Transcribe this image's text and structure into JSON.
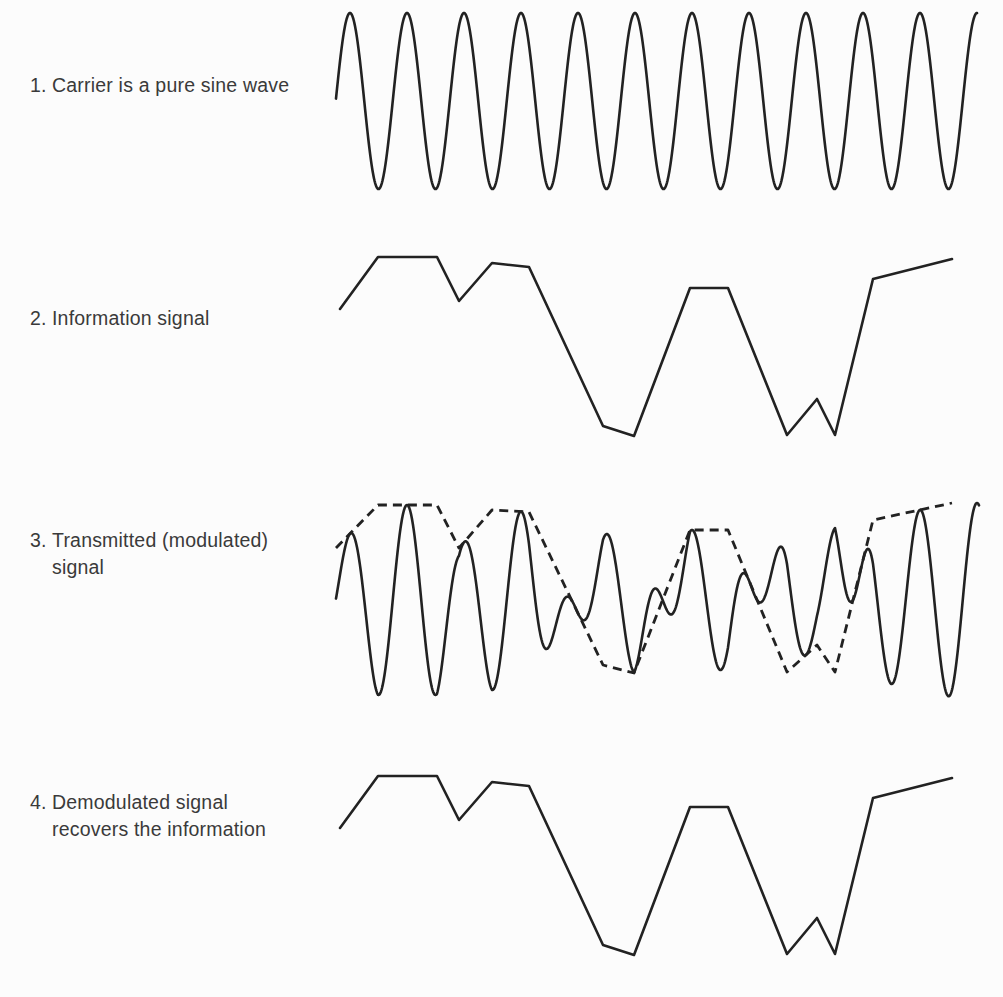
{
  "figure": {
    "background_color": "#fcfcfc",
    "line_color": "#222222",
    "text_color": "#3a3a3a"
  },
  "panels": [
    {
      "number": "1.",
      "label": "Carrier is a pure sine wave",
      "label_top": 45,
      "kind": "sine",
      "name": "carrier"
    },
    {
      "number": "2.",
      "label": "Information signal",
      "label_top": 278,
      "kind": "polyline",
      "name": "information"
    },
    {
      "number": "3.",
      "label": "Transmitted (modulated) signal",
      "label_top": 500,
      "kind": "modulated",
      "name": "modulated"
    },
    {
      "number": "4.",
      "label": "Demodulated signal recovers the information",
      "label_top": 762,
      "kind": "polyline",
      "name": "demodulated"
    }
  ],
  "chart_data": {
    "type": "line",
    "xlabel": "",
    "ylabel": "",
    "grid": false,
    "legend": "none",
    "series": [
      {
        "name": "carrier",
        "description": "pure sine wave, constant amplitude",
        "kind": "sine",
        "x_start": 336,
        "x_end": 977,
        "peak_y": 38,
        "trough_y": 215,
        "center_y": 126,
        "amplitude": 88,
        "period": 57,
        "phase_x_first_peak": 350,
        "svg_top": 25,
        "svg_height": 215
      },
      {
        "name": "information",
        "description": "piecewise-linear modulating waveform",
        "kind": "polyline",
        "svg_top": 255,
        "svg_height": 215,
        "points": [
          [
            340,
            324
          ],
          [
            378,
            272
          ],
          [
            437,
            272
          ],
          [
            459,
            316
          ],
          [
            492,
            278
          ],
          [
            529,
            282
          ],
          [
            603,
            441
          ],
          [
            634,
            451
          ],
          [
            690,
            303
          ],
          [
            728,
            303
          ],
          [
            787,
            450
          ],
          [
            817,
            414
          ],
          [
            835,
            450
          ],
          [
            873,
            294
          ],
          [
            952,
            274
          ]
        ]
      },
      {
        "name": "modulated",
        "description": "carrier amplitude-scaled by the information signal; dashed line is the envelope",
        "kind": "modulated",
        "svg_top": 490,
        "svg_height": 230,
        "center_y": 600,
        "baseline_trough_y": 690,
        "carrier_period": 57,
        "carrier_first_peak_x": 350,
        "x_start": 336,
        "x_end": 979,
        "envelope_points": [
          [
            336,
            548
          ],
          [
            378,
            505
          ],
          [
            437,
            505
          ],
          [
            459,
            548
          ],
          [
            492,
            510
          ],
          [
            529,
            512
          ],
          [
            603,
            665
          ],
          [
            634,
            673
          ],
          [
            690,
            530
          ],
          [
            728,
            530
          ],
          [
            787,
            672
          ],
          [
            817,
            645
          ],
          [
            835,
            672
          ],
          [
            873,
            520
          ],
          [
            952,
            503
          ]
        ]
      },
      {
        "name": "demodulated",
        "description": "recovered information signal, identical in shape to series 2",
        "kind": "polyline",
        "svg_top": 760,
        "svg_height": 215,
        "points": [
          [
            340,
            828
          ],
          [
            378,
            776
          ],
          [
            437,
            776
          ],
          [
            459,
            820
          ],
          [
            492,
            782
          ],
          [
            529,
            786
          ],
          [
            603,
            945
          ],
          [
            634,
            955
          ],
          [
            690,
            807
          ],
          [
            728,
            807
          ],
          [
            787,
            954
          ],
          [
            817,
            918
          ],
          [
            835,
            954
          ],
          [
            873,
            798
          ],
          [
            952,
            778
          ]
        ]
      }
    ]
  }
}
